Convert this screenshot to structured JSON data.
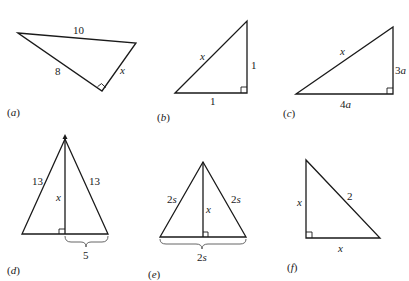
{
  "figures": {
    "a": {
      "caption_open": "(",
      "caption_letter": "a",
      "caption_close": ")",
      "hypotenuse": "10",
      "leg1": "8",
      "leg2": "x"
    },
    "b": {
      "caption_open": "(",
      "caption_letter": "b",
      "caption_close": ")",
      "hypotenuse": "x",
      "vertical_leg": "1",
      "horizontal_leg": "1"
    },
    "c": {
      "caption_open": "(",
      "caption_letter": "c",
      "caption_close": ")",
      "hypotenuse": "x",
      "vertical_leg_num": "3",
      "vertical_leg_var": "a",
      "horizontal_leg_num": "4",
      "horizontal_leg_var": "a"
    },
    "d": {
      "caption_open": "(",
      "caption_letter": "d",
      "caption_close": ")",
      "left_side": "13",
      "right_side": "13",
      "altitude": "x",
      "half_base": "5"
    },
    "e": {
      "caption_open": "(",
      "caption_letter": "e",
      "caption_close": ")",
      "left_num": "2",
      "left_var": "s",
      "right_num": "2",
      "right_var": "s",
      "altitude": "x",
      "base_num": "2",
      "base_var": "s"
    },
    "f": {
      "caption_open": "(",
      "caption_letter": "f",
      "caption_close": ")",
      "vertical_leg": "x",
      "hypotenuse": "2",
      "horizontal_leg": "x"
    }
  }
}
